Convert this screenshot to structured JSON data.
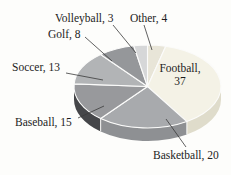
{
  "figure": {
    "kind": "3d-pie-chart-scan"
  },
  "chart_data": {
    "type": "pie",
    "style": "3d",
    "direction": "clockwise",
    "start_angle_deg": 0,
    "total": 100,
    "slices": [
      {
        "label": "Other",
        "value": 4,
        "color": "#e8e5d8",
        "side_color": "#cfccbf"
      },
      {
        "label": "Football",
        "value": 37,
        "color": "#f4f2e6",
        "side_color": "#dfdccb"
      },
      {
        "label": "Basketball",
        "value": 20,
        "color": "#a8aaad",
        "side_color": "#8e9093"
      },
      {
        "label": "Baseball",
        "value": 15,
        "color": "#98999c",
        "side_color": "#454649"
      },
      {
        "label": "Soccer",
        "value": 13,
        "color": "#b2b4b6",
        "side_color": "#96989a"
      },
      {
        "label": "Golf",
        "value": 8,
        "color": "#95979a",
        "side_color": "#77797c"
      },
      {
        "label": "Volleyball",
        "value": 3,
        "color": "#d6d7d8",
        "side_color": "#b8b9ba"
      }
    ]
  },
  "callouts": {
    "volleyball": "Volleyball, 3",
    "other": "Other, 4",
    "golf": "Golf, 8",
    "soccer": "Soccer, 13",
    "baseball": "Baseball, 15",
    "basketball": "Basketball, 20",
    "football_line1": "Football,",
    "football_line2": "37"
  }
}
